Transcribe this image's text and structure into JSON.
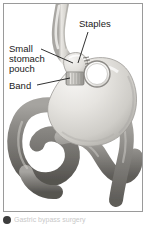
{
  "figure": {
    "type": "medical-illustration",
    "frame_border_color": "#9a9a9a",
    "background_color": "#ffffff"
  },
  "labels": [
    {
      "id": "staples",
      "text": "Staples",
      "lines": [
        "Staples"
      ],
      "x": 75,
      "y": 15,
      "leader": {
        "from_x": 84,
        "from_y": 28,
        "to_x": 74,
        "to_y": 60
      }
    },
    {
      "id": "small-stomach-pouch",
      "text": "Small stomach pouch",
      "lines": [
        "Small",
        "stomach",
        "pouch"
      ],
      "x": 5,
      "y": 40,
      "leader": {
        "from_x": 37,
        "from_y": 45,
        "to_x": 68,
        "to_y": 59
      }
    },
    {
      "id": "band",
      "text": "Band",
      "lines": [
        "Band"
      ],
      "x": 5,
      "y": 77,
      "leader": {
        "from_x": 33,
        "from_y": 81,
        "to_x": 67,
        "to_y": 74
      }
    }
  ],
  "anatomy": {
    "esophagus": {
      "name": "esophagus",
      "fill": "#d8d6d2"
    },
    "stomach_pouch": {
      "name": "small-stomach-pouch",
      "fill": "#e6e4e0"
    },
    "stomach_body": {
      "name": "stomach-body",
      "fill": "#d9d7d2"
    },
    "band": {
      "name": "gastric-band",
      "fill": "#cfcdc9",
      "stripes": true
    },
    "band_ring": {
      "name": "band-ring-opening",
      "fill": "#ffffff",
      "stroke": "#8d8b87"
    },
    "intestine": {
      "name": "small-intestine",
      "fill": "#8e8c88"
    }
  },
  "colors": {
    "ink": "#1a1a1a",
    "frame": "#9a9a9a",
    "tissue_light": "#e8e6e2",
    "tissue_mid": "#c9c7c2",
    "tissue_dark": "#7e7c78",
    "bullet": "#3d3d3d"
  },
  "caption": {
    "bullet_icon": "filled-circle-icon",
    "text": "Gastric bypass surgery"
  }
}
